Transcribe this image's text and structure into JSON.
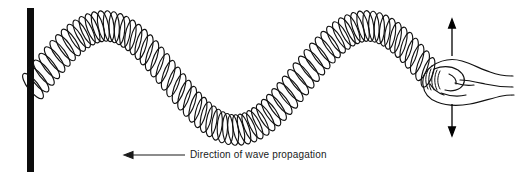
{
  "figure": {
    "background_color": "#ffffff",
    "ink_color": "#000000",
    "caption_color": "#1a1a1a"
  },
  "wall": {
    "label": "fixed support post",
    "color": "#0d0d0d",
    "x": 27,
    "y_top": 8,
    "width": 7,
    "height": 164
  },
  "spring": {
    "label": "coiled spring",
    "attachment_point": "fixed-end-at-post",
    "free_end": "held-in-hand",
    "coil_count": 74,
    "stroke_color": "#111111",
    "wave": {
      "start_x": 33,
      "end_x": 428,
      "axis_y": 78,
      "amplitude": 52,
      "wavelength": 262,
      "crest_1_x": 105,
      "trough_x": 236,
      "crest_2_x": 367
    }
  },
  "hand": {
    "label": "hand gripping free end of spring",
    "stroke_color": "#111111",
    "grip_x": 430,
    "grip_y": 80
  },
  "motion_arrow": {
    "label": "hand oscillation direction",
    "orientation": "vertical-double-headed",
    "x": 452,
    "top_y": 22,
    "bottom_y": 134,
    "color": "#000000"
  },
  "propagation_arrow": {
    "label": "wave propagation direction",
    "orientation": "horizontal-left",
    "tail_x": 185,
    "head_x": 126,
    "y": 155,
    "color": "#1a1a1a"
  },
  "caption": {
    "text": "Direction of wave propagation"
  }
}
